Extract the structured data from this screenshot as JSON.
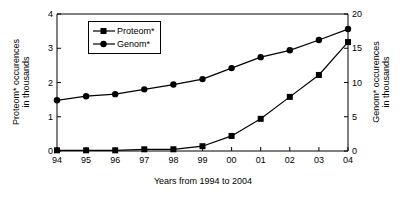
{
  "chart_data": {
    "type": "line",
    "title": "",
    "xlabel": "Years from 1994 to 2004",
    "categories": [
      "94",
      "95",
      "96",
      "97",
      "98",
      "99",
      "00",
      "01",
      "02",
      "03",
      "04"
    ],
    "grid": false,
    "legend_position": "top-left",
    "axes": {
      "left": {
        "label_line1": "Proteom* occurences",
        "label_line2": "in thousands",
        "ylim": [
          0,
          4
        ],
        "ticks": [
          "0",
          "1",
          "2",
          "3",
          "4"
        ],
        "tick_values": [
          0,
          1,
          2,
          3,
          4
        ]
      },
      "right": {
        "label_line1": "Genom* occurences",
        "label_line2": "in thousands",
        "ylim": [
          0,
          20
        ],
        "ticks": [
          "0",
          "5",
          "10",
          "15",
          "20"
        ],
        "tick_values": [
          0,
          5,
          10,
          15,
          20
        ]
      }
    },
    "series": [
      {
        "name": "Proteom*",
        "axis": "left",
        "marker": "square",
        "color": "#000000",
        "values": [
          0.02,
          0.02,
          0.02,
          0.05,
          0.05,
          0.14,
          0.44,
          0.94,
          1.58,
          2.22,
          3.18
        ]
      },
      {
        "name": "Genom*",
        "axis": "right",
        "marker": "circle",
        "color": "#000000",
        "values": [
          7.4,
          8.0,
          8.3,
          9.0,
          9.7,
          10.5,
          12.1,
          13.7,
          14.7,
          16.2,
          17.8
        ]
      }
    ]
  }
}
